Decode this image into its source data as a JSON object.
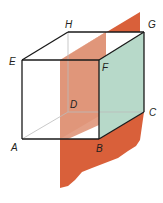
{
  "diagram": {
    "type": "cube-with-intersecting-plane",
    "vertices": {
      "A": {
        "label": "A"
      },
      "B": {
        "label": "B"
      },
      "C": {
        "label": "C"
      },
      "D": {
        "label": "D"
      },
      "E": {
        "label": "E"
      },
      "F": {
        "label": "F"
      },
      "G": {
        "label": "G"
      },
      "H": {
        "label": "H"
      }
    },
    "shaded_face": "BCGF",
    "colors": {
      "plane": "#d9603a",
      "plane_inside": "#e0967a",
      "face_bcgf": "#b7d9c9",
      "edges": "#1a1a1a",
      "hidden_edges": "#bbbbbb"
    }
  }
}
